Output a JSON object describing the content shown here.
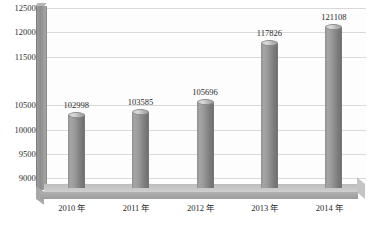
{
  "chart_data": {
    "type": "bar",
    "title": "",
    "subtitle": "",
    "xlabel": "",
    "ylabel": "",
    "categories": [
      "2010 年",
      "2011 年",
      "2012 年",
      "2013 年",
      "2014 年"
    ],
    "values": [
      102998,
      103585,
      105696,
      117826,
      121108
    ],
    "data_labels": [
      "102998",
      "103585",
      "105696",
      "117826",
      "121108"
    ],
    "ylim": [
      88000,
      125000
    ],
    "ytick_values": [
      125000,
      120000,
      115000,
      105000,
      100000,
      95000,
      90000
    ],
    "ytick_labels": [
      "125000",
      "120000",
      "115000",
      "105000",
      "100000",
      "95000",
      "90000"
    ],
    "grid": true,
    "grid_orientation": "horizontal",
    "legend": false,
    "legend_position": "none",
    "style": "3d-cylinder",
    "bar_color": "#8f8f8f",
    "grid_color": "#d9d9d9",
    "plot_background": "#fdfdfd",
    "floor_color": "#bdbdbd",
    "wall_color": "#9a9a9a",
    "text_color": "#2b2b2b"
  }
}
